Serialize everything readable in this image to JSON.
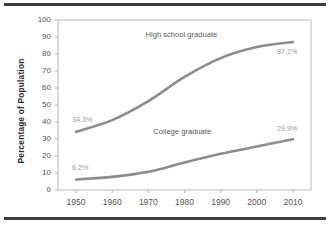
{
  "chart_data": {
    "type": "line",
    "title": "",
    "xlabel": "",
    "ylabel": "Percentage of Population",
    "categories": [
      "1950",
      "1960",
      "1970",
      "1980",
      "1990",
      "2000",
      "2010"
    ],
    "x": [
      1950,
      1960,
      1970,
      1980,
      1990,
      2000,
      2010
    ],
    "xlim": [
      1945,
      2015
    ],
    "ylim": [
      0,
      100
    ],
    "ytick_labels": [
      "0",
      "10",
      "20",
      "30",
      "40",
      "50",
      "60",
      "70",
      "80",
      "90",
      "100"
    ],
    "yticks": [
      0,
      10,
      20,
      30,
      40,
      50,
      60,
      70,
      80,
      90,
      100
    ],
    "grid": false,
    "legend_position": "inline-annotation",
    "series": [
      {
        "name": "High school graduate",
        "values": [
          34.3,
          41.1,
          52.3,
          66.5,
          77.6,
          84.1,
          87.1
        ],
        "color": "#8c8c8c",
        "label_text": "High school graduate",
        "start_label": "34.3%",
        "end_label": "87.1%"
      },
      {
        "name": "College graduate",
        "values": [
          6.2,
          7.7,
          10.7,
          16.2,
          21.3,
          25.6,
          29.9
        ],
        "color": "#8c8c8c",
        "label_text": "College graduate",
        "start_label": "6.2%",
        "end_label": "29.9%"
      }
    ],
    "annotations": [
      {
        "text": "High school graduate",
        "x": 1980,
        "y": 91
      },
      {
        "text": "College graduate",
        "x": 1980,
        "y": 34
      },
      {
        "text": "34.3%",
        "x": 1950,
        "y": 41
      },
      {
        "text": "6.2%",
        "x": 1950,
        "y": 13
      },
      {
        "text": "87.1%",
        "x": 2010,
        "y": 81
      },
      {
        "text": "29.9%",
        "x": 2010,
        "y": 36
      }
    ],
    "colors": {
      "line": "#8c8c8c",
      "frame": "#b8b8b8",
      "tick_text": "#555555",
      "value_label": "#9b9b9b",
      "rule": "#3d3d3d"
    }
  }
}
